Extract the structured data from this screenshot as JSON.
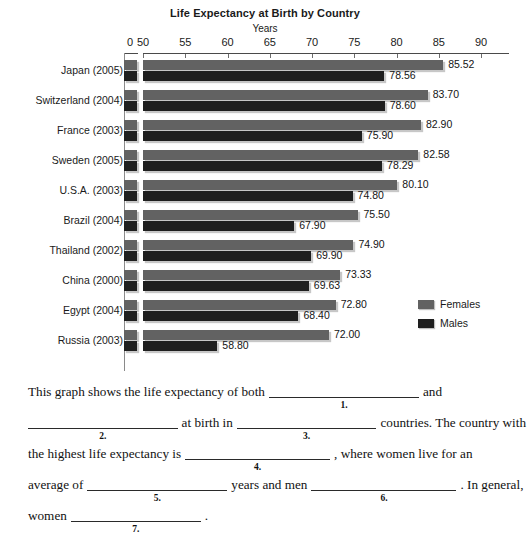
{
  "chart_data": {
    "type": "bar",
    "orientation": "horizontal",
    "title": "Life Expectancy at Birth by Country",
    "xlabel": "Years",
    "ylabel": "",
    "categories": [
      "Japan (2005)",
      "Switzerland (2004)",
      "France (2003)",
      "Sweden (2005)",
      "U.S.A. (2003)",
      "Brazil (2004)",
      "Thailand (2002)",
      "China (2000)",
      "Egypt (2004)",
      "Russia (2003)"
    ],
    "series": [
      {
        "name": "Females",
        "color": "#626262",
        "values": [
          85.52,
          83.7,
          82.9,
          82.58,
          80.1,
          75.5,
          74.9,
          73.33,
          72.8,
          72.0
        ],
        "labels": [
          "85.52",
          "83.70",
          "82.90",
          "82.58",
          "80.10",
          "75.50",
          "74.90",
          "73.33",
          "72.80",
          "72.00"
        ]
      },
      {
        "name": "Males",
        "color": "#1f1f1f",
        "values": [
          78.56,
          78.6,
          75.9,
          78.29,
          74.8,
          67.9,
          69.9,
          69.63,
          68.4,
          58.8
        ],
        "labels": [
          "78.56",
          "78.60",
          "75.90",
          "78.29",
          "74.80",
          "67.90",
          "69.90",
          "69.63",
          "68.40",
          "58.80"
        ]
      }
    ],
    "xticks": [
      0,
      50,
      55,
      60,
      65,
      70,
      75,
      80,
      85,
      90
    ],
    "xtick_labels": [
      "0",
      "50",
      "55",
      "60",
      "65",
      "70",
      "75",
      "80",
      "85",
      "90"
    ],
    "axis_break": true,
    "xlim": [
      50,
      90
    ],
    "grid": false,
    "legend_position": "right"
  },
  "legend": {
    "items": [
      {
        "label": "Females"
      },
      {
        "label": "Males"
      }
    ]
  },
  "exercise": {
    "lines": [
      {
        "parts": [
          {
            "type": "text",
            "text": "This graph shows the life expectancy of both"
          },
          {
            "type": "blank",
            "num": "1.",
            "width": 150
          },
          {
            "type": "text",
            "text": "and"
          }
        ]
      },
      {
        "parts": [
          {
            "type": "blank",
            "num": "2.",
            "width": 150
          },
          {
            "type": "text",
            "text": "at birth in"
          },
          {
            "type": "blank",
            "num": "3.",
            "width": 140
          },
          {
            "type": "text",
            "text": "countries. The country with"
          }
        ]
      },
      {
        "parts": [
          {
            "type": "text",
            "text": "the highest life expectancy is"
          },
          {
            "type": "blank",
            "num": "4.",
            "width": 145
          },
          {
            "type": "text",
            "text": ", where women live for an"
          }
        ]
      },
      {
        "parts": [
          {
            "type": "text",
            "text": "average of"
          },
          {
            "type": "blank",
            "num": "5.",
            "width": 140
          },
          {
            "type": "text",
            "text": "years and men"
          },
          {
            "type": "blank",
            "num": "6.",
            "width": 145
          },
          {
            "type": "text",
            "text": ". In general,"
          }
        ]
      },
      {
        "parts": [
          {
            "type": "text",
            "text": "women"
          },
          {
            "type": "blank",
            "num": "7.",
            "width": 130
          },
          {
            "type": "text",
            "text": "."
          }
        ]
      }
    ]
  }
}
